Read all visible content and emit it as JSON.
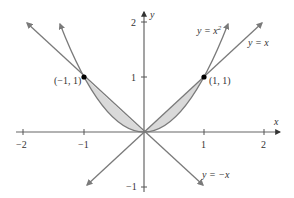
{
  "figure": {
    "x_axis_label": "x",
    "y_axis_label": "y",
    "x_ticks": [
      {
        "value": -2,
        "label": "−2"
      },
      {
        "value": -1,
        "label": "−1"
      },
      {
        "value": 1,
        "label": "1"
      },
      {
        "value": 2,
        "label": "2"
      }
    ],
    "y_ticks": [
      {
        "value": 1,
        "label": "1"
      },
      {
        "value": 2,
        "label": "2"
      },
      {
        "value": -1,
        "label": "−1"
      }
    ],
    "curves": {
      "parabola": {
        "label_lhs": "y = x",
        "label_exp": "2"
      },
      "line_pos": {
        "label": "y = x"
      },
      "line_neg": {
        "label": "y = −x"
      }
    },
    "points": [
      {
        "label": "(−1, 1)",
        "x": -1,
        "y": 1
      },
      {
        "label": "(1, 1)",
        "x": 1,
        "y": 1
      }
    ],
    "colors": {
      "axis": "#555555",
      "curve": "#7a7a7a",
      "shade": "#d9d9d9",
      "point": "#000000"
    }
  }
}
